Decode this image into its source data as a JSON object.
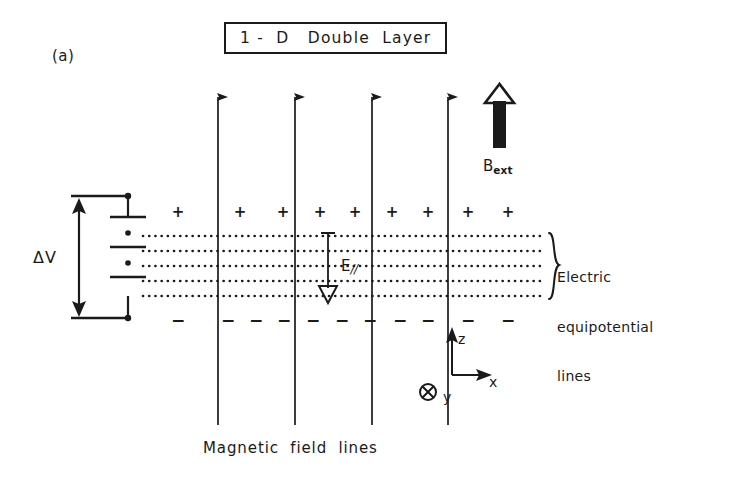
{
  "figure": {
    "title": "1 -  D   Double  Layer",
    "panel_label": "(a)",
    "caption": "Magnetic  field  lines",
    "ink_color": "#1a1a1a",
    "background_color": "#ffffff"
  },
  "labels": {
    "b_ext": "B",
    "b_ext_sub": "ext",
    "delta_v": "ΔV",
    "e_parallel": "E",
    "e_parallel_sub": "//",
    "equipotential_line1": "Electric",
    "equipotential_line2": "equipotential",
    "equipotential_line3": "lines"
  },
  "axes": {
    "z": "z",
    "x": "x",
    "y": "y"
  },
  "diagram": {
    "magnetic_field_lines_x": [
      218,
      295,
      372,
      448
    ],
    "magnetic_field_line_top": 86,
    "magnetic_field_line_bottom": 425,
    "equipotential_line_y": [
      236,
      251,
      266,
      281,
      296
    ],
    "equipotential_x_start": 142,
    "equipotential_x_end": 545,
    "plus_signs_x": [
      178,
      240,
      283,
      320,
      355,
      392,
      428,
      468,
      508
    ],
    "plus_signs_y": 212,
    "minus_signs_x": [
      178,
      228,
      256,
      284,
      313,
      342,
      370,
      400,
      428,
      468,
      508
    ],
    "minus_signs_y": 320,
    "e_parallel_arrow_x": 328,
    "e_parallel_arrow_top": 232,
    "e_parallel_arrow_bottom": 300,
    "b_ext_arrow_x": 500,
    "b_ext_arrow_top": 86,
    "b_ext_arrow_bottom": 148,
    "brace_x": 548,
    "axis_origin_x": 452,
    "axis_origin_y": 375,
    "battery_x": 127,
    "battery_plate_ys": [
      215,
      245,
      275
    ],
    "delta_v_arrow_x": 79
  }
}
